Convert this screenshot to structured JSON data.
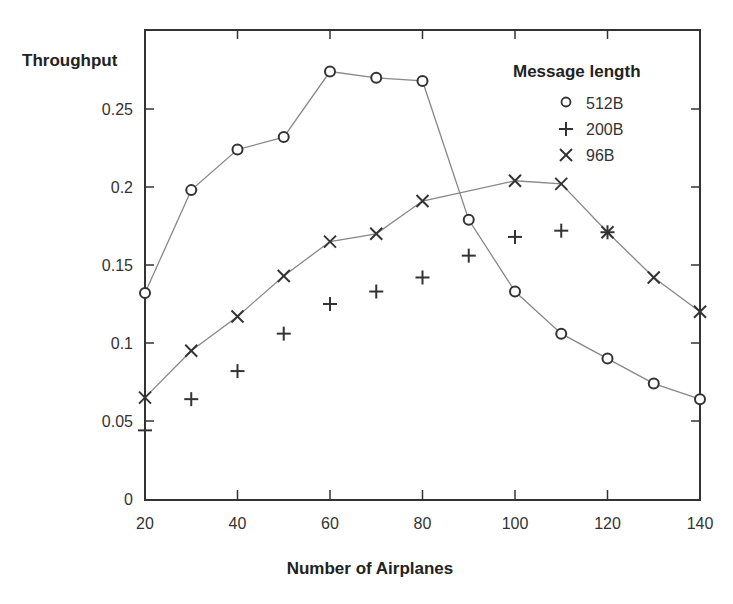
{
  "chart_data": {
    "type": "line",
    "title": "",
    "xlabel": "Number of Airplanes",
    "ylabel": "Throughput",
    "xlim": [
      20,
      140
    ],
    "ylim": [
      0,
      0.28
    ],
    "x_ticks": [
      20,
      40,
      60,
      80,
      100,
      120,
      140
    ],
    "x_tick_labels": [
      "20",
      "40",
      "60",
      "80",
      "100",
      "120",
      "140"
    ],
    "y_ticks": [
      0,
      0.05,
      0.1,
      0.15,
      0.2,
      0.25
    ],
    "y_tick_labels": [
      "0",
      "0.05",
      "0.1",
      "0.15",
      "0.2",
      "0.25"
    ],
    "grid": false,
    "legend": {
      "title": "Message length",
      "position": "upper right",
      "entries": [
        {
          "marker": "o",
          "label": "512B"
        },
        {
          "marker": "+",
          "label": "200B"
        },
        {
          "marker": "x",
          "label": "96B"
        }
      ]
    },
    "series": [
      {
        "name": "512B",
        "marker": "o",
        "line": true,
        "x": [
          20,
          30,
          40,
          50,
          60,
          70,
          80,
          90,
          100,
          110,
          120,
          130,
          140
        ],
        "values": [
          0.132,
          0.198,
          0.224,
          0.232,
          0.274,
          0.27,
          0.268,
          0.179,
          0.133,
          0.106,
          0.09,
          0.074,
          0.064
        ]
      },
      {
        "name": "200B",
        "marker": "+",
        "line": false,
        "x": [
          20,
          30,
          40,
          50,
          60,
          70,
          80,
          90,
          100,
          110,
          120
        ],
        "values": [
          0.044,
          0.064,
          0.082,
          0.106,
          0.125,
          0.133,
          0.142,
          0.156,
          0.168,
          0.172,
          0.171
        ]
      },
      {
        "name": "96B",
        "marker": "x",
        "line": true,
        "x": [
          20,
          30,
          40,
          50,
          60,
          70,
          80,
          100,
          110,
          120,
          130,
          140
        ],
        "values": [
          0.065,
          0.095,
          0.117,
          0.143,
          0.165,
          0.17,
          0.191,
          0.204,
          0.202,
          0.171,
          0.142,
          0.12
        ]
      }
    ]
  },
  "colors": {
    "axis": "#333333",
    "line": "#888888",
    "marker": "#333333",
    "background": "#ffffff"
  }
}
